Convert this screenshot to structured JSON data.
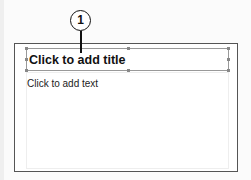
{
  "slide": {
    "title_placeholder": "Click to add title",
    "body_placeholder": "Click to add text"
  },
  "callout": {
    "number": "1"
  }
}
